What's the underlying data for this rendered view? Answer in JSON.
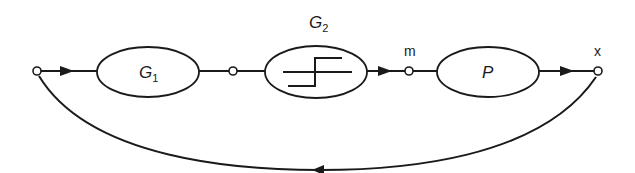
{
  "diagram": {
    "type": "block-diagram",
    "blocks": [
      {
        "id": "G1",
        "label": "G",
        "subscript": "1"
      },
      {
        "id": "G2",
        "label": "G",
        "subscript": "2",
        "content": "relay-step-characteristic"
      },
      {
        "id": "P",
        "label": "P"
      }
    ],
    "signal_labels": {
      "m": "m",
      "x": "x"
    },
    "edges": [
      {
        "from": "input-node",
        "to": "G1",
        "arrow": true
      },
      {
        "from": "G1",
        "to": "junction-node",
        "arrow": false
      },
      {
        "from": "junction-node",
        "to": "G2",
        "arrow": false
      },
      {
        "from": "G2",
        "to": "m-node",
        "arrow": true
      },
      {
        "from": "m-node",
        "to": "P",
        "arrow": false
      },
      {
        "from": "P",
        "to": "x-node",
        "arrow": true
      },
      {
        "from": "x-node",
        "to": "input-node",
        "arrow": true,
        "kind": "feedback-arc"
      }
    ],
    "colors": {
      "stroke": "#1a1a1a",
      "background": "#ffffff"
    }
  }
}
